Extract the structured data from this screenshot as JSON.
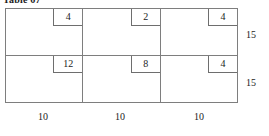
{
  "figure": {
    "caption": "Table 67"
  },
  "grid": {
    "rows": [
      {
        "side_label": "15",
        "cells": [
          {
            "value": "4"
          },
          {
            "value": "2"
          },
          {
            "value": "4"
          }
        ]
      },
      {
        "side_label": "15",
        "cells": [
          {
            "value": "12"
          },
          {
            "value": "8"
          },
          {
            "value": "4"
          }
        ]
      }
    ],
    "column_labels": [
      "10",
      "10",
      "10"
    ]
  },
  "chart_data": {
    "type": "table",
    "title": "Table 67",
    "categories": [
      "10",
      "10",
      "10"
    ],
    "row_labels": [
      "15",
      "15"
    ],
    "series": [
      {
        "name": "15",
        "values": [
          4,
          2,
          4
        ]
      },
      {
        "name": "15",
        "values": [
          12,
          8,
          4
        ]
      }
    ],
    "xlabel": "",
    "ylabel": ""
  }
}
